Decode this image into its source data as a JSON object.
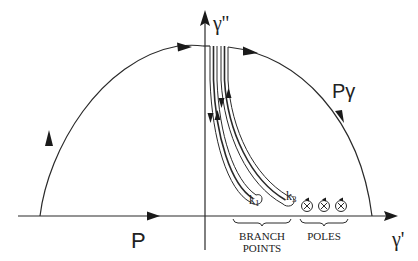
{
  "diagram": {
    "axes": {
      "horizontal_label": "γ'",
      "vertical_label": "γ''"
    },
    "contours": {
      "real_path_label": "P",
      "arc_path_label": "Pγ"
    },
    "branch_points": {
      "labels": [
        "k1",
        "k3"
      ],
      "k1_main": "k",
      "k1_sub": "1",
      "k3_main": "k",
      "k3_sub": "3",
      "group_label_line1": "BRANCH",
      "group_label_line2": "POINTS"
    },
    "poles": {
      "count": 3,
      "marker": "⊗",
      "group_label": "POLES"
    }
  }
}
